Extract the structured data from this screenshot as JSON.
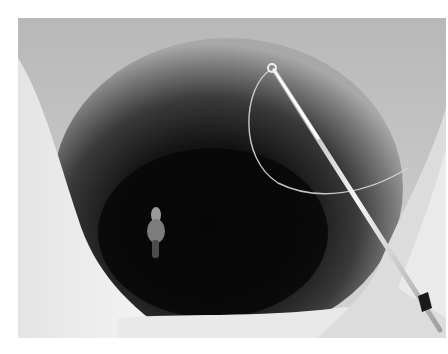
{
  "image": {
    "subject": "Ice fishing hole with fishing rod and lure",
    "style": "grayscale photograph",
    "colors": {
      "ice_light": "#f2f2f2",
      "ice_mid": "#c8c8c8",
      "hole_wall": "#6e6e6e",
      "water_dark": "#0c0c0c",
      "rod": "#e8e8e8"
    },
    "elements": [
      {
        "name": "ice-surface",
        "description": "snow and ice around the hole"
      },
      {
        "name": "ice-hole",
        "description": "deep circular hole drilled through ice"
      },
      {
        "name": "fishing-rod",
        "description": "white rod entering from lower right"
      },
      {
        "name": "fishing-line",
        "description": "curved line from rod tip into hole"
      },
      {
        "name": "lure",
        "description": "small lure/bobber in dark water"
      }
    ]
  }
}
